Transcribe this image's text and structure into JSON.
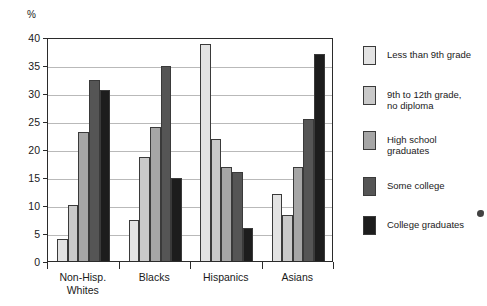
{
  "chart_data": {
    "type": "bar",
    "title": "",
    "xlabel": "",
    "ylabel": "%",
    "ylim": [
      0,
      40
    ],
    "yticks": [
      0,
      5,
      10,
      15,
      20,
      25,
      30,
      35,
      40
    ],
    "ytick_labels": [
      "0",
      "5",
      "10",
      "15",
      "20",
      "25",
      "30",
      "35",
      "40"
    ],
    "grid": true,
    "legend_position": "right",
    "categories": [
      "Non-Hisp.\nWhites",
      "Blacks",
      "Hispanics",
      "Asians"
    ],
    "category_labels_flat": [
      "Non-Hisp. Whites",
      "Blacks",
      "Hispanics",
      "Asians"
    ],
    "series": [
      {
        "name": "Less than 9th grade",
        "color": "#e3e3e3",
        "values": [
          4.0,
          7.4,
          38.8,
          11.9
        ]
      },
      {
        "name": "9th to 12th grade,\nno diploma",
        "color": "#c9c9c9",
        "values": [
          10.0,
          18.6,
          21.8,
          8.2
        ]
      },
      {
        "name": "High school\ngraduates",
        "color": "#a6a6a6",
        "values": [
          23.0,
          24.0,
          16.8,
          16.8
        ]
      },
      {
        "name": "Some college",
        "color": "#555555",
        "values": [
          32.3,
          34.8,
          15.9,
          25.3
        ]
      },
      {
        "name": "College graduates",
        "color": "#1d1d1d",
        "values": [
          30.5,
          14.8,
          5.9,
          36.9
        ]
      }
    ]
  },
  "axis": {
    "unit_label": "%"
  },
  "legend": {
    "items": [
      {
        "label": "Less than 9th grade",
        "color": "#e3e3e3"
      },
      {
        "label": "9th to 12th grade,\nno diploma",
        "color": "#c9c9c9"
      },
      {
        "label": "High school\ngraduates",
        "color": "#a6a6a6"
      },
      {
        "label": "Some college",
        "color": "#555555"
      },
      {
        "label": "College graduates",
        "color": "#1d1d1d"
      }
    ]
  }
}
